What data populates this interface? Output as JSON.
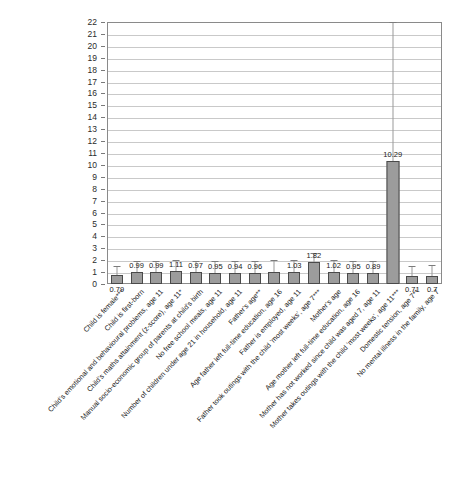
{
  "chart_data": {
    "type": "bar",
    "title": "",
    "subtitle": "",
    "xlabel": "",
    "ylabel": "",
    "ylim": [
      0,
      22
    ],
    "ytick_step": 1,
    "grid": true,
    "legend": false,
    "legend_position": "none",
    "y_ticks": [
      "22",
      "21",
      "20",
      "19",
      "18",
      "17",
      "16",
      "15",
      "14",
      "13",
      "12",
      "11",
      "10",
      "9",
      "8",
      "7",
      "6",
      "5",
      "4",
      "3",
      "2",
      "1",
      "0"
    ],
    "categories": [
      "Child is female***",
      "Child is first-born",
      "Child's emotional and behavioural problems, age 11",
      "Child's maths attainment (z-score), age 11*",
      "Manual socio-economic group of parents at child's birth",
      "No free school meals, age 11",
      "Number of children under age 21 in household, age 11",
      "Father's age**",
      "Age father left full-time education, age 16",
      "Father is employed, age 11",
      "Father took outings with the child 'most weeks', age 7***",
      "Mother's age",
      "Age mother left full-time education, age 16",
      "Mother has not worked since child was aged 7, age 11",
      "Mother takes outings with the child 'most weeks', age 11***",
      "Domestic tension, age 7**",
      "No mental illness in the family, age 7"
    ],
    "values": [
      0.79,
      0.99,
      0.99,
      1.11,
      0.97,
      0.95,
      0.94,
      0.96,
      1.0,
      1.03,
      1.82,
      1.02,
      0.95,
      0.89,
      10.29,
      0.71,
      0.7
    ],
    "value_labels": [
      "0.79",
      "0.99",
      "0.99",
      "1.11",
      "0.97",
      "0.95",
      "0.94",
      "0.96",
      "",
      "1.03",
      "1.82",
      "1.02",
      "0.95",
      "0.89",
      "10.29",
      "0.71",
      "0.7"
    ],
    "error_low": [
      0.62,
      0.12,
      0.25,
      0.55,
      0.48,
      0.5,
      0.52,
      0.55,
      0.2,
      0.35,
      0.72,
      0.32,
      0.48,
      0.47,
      0.3,
      0.55,
      0.52
    ],
    "error_high": [
      1.55,
      1.92,
      1.92,
      2.0,
      1.92,
      1.92,
      1.92,
      1.92,
      2.05,
      2.02,
      2.6,
      2.0,
      1.92,
      1.92,
      22.0,
      1.55,
      1.58
    ],
    "colors": {
      "bar_fill": "#9c9c9c",
      "bar_border": "#4a4a4a",
      "error_bar": "#9a9a9a",
      "gridline": "#c9c9c9",
      "axis": "#8a8a8a",
      "text": "#232323"
    }
  }
}
